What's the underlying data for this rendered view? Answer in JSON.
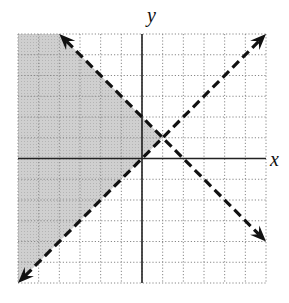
{
  "chart_data": {
    "type": "line",
    "title": "",
    "xlabel": "x",
    "ylabel": "y",
    "xlim": [
      -6,
      6
    ],
    "ylim": [
      -6,
      6
    ],
    "grid": true,
    "grid_style": "dotted",
    "grid_step": 1,
    "series": [
      {
        "name": "y = -x + 2",
        "style": "dashed",
        "arrows": "both",
        "points": [
          [
            -4,
            6
          ],
          [
            6,
            -4
          ]
        ],
        "slope": -1,
        "intercept": 2
      },
      {
        "name": "y = x",
        "style": "dashed",
        "arrows": "both",
        "points": [
          [
            -6,
            -6
          ],
          [
            6,
            6
          ]
        ],
        "slope": 1,
        "intercept": 0
      }
    ],
    "intersection": [
      1,
      1
    ],
    "shaded_region": {
      "description": "Region where y > x and y < -x + 2 (left of both lines)",
      "polygon": [
        [
          -6,
          -6
        ],
        [
          1,
          1
        ],
        [
          -4,
          6
        ],
        [
          -6,
          6
        ]
      ],
      "color": "#c8c8c8"
    }
  },
  "labels": {
    "x_axis": "x",
    "y_axis": "y"
  },
  "colors": {
    "shade": "#c8c8c8",
    "line": "#111111",
    "grid": "#888888",
    "axis": "#222222"
  }
}
